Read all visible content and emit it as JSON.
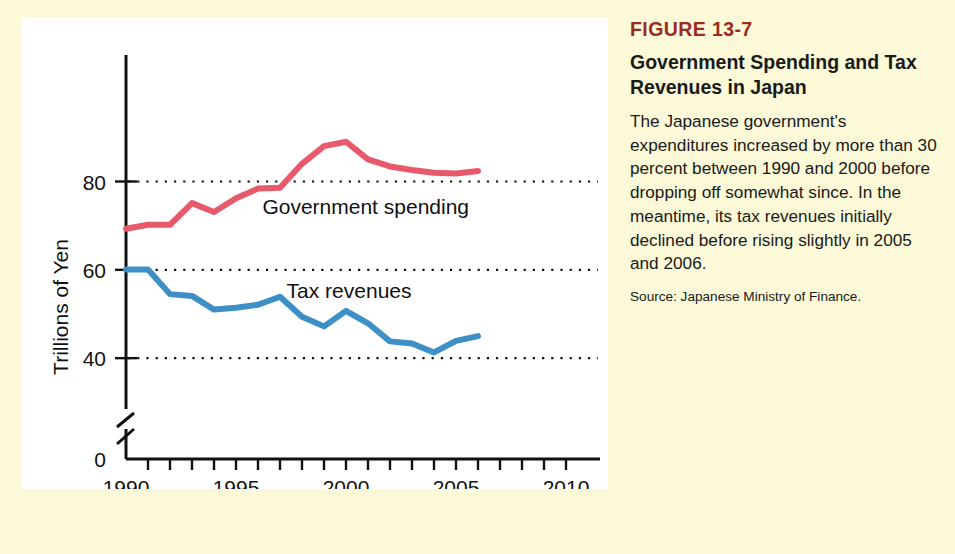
{
  "caption": {
    "figure_number": "FIGURE 13-7",
    "title": "Government Spending and Tax Revenues in Japan",
    "body": "The Japanese government's expenditures increased by more than 30 percent between 1990 and 2000 before dropping off somewhat since. In the meantime, its tax revenues initially declined before rising slightly in 2005 and 2006.",
    "source": "Source: Japanese Ministry of Finance."
  },
  "colors": {
    "background": "#fbf9d7",
    "panel": "#ffffff",
    "figure_number": "#9c2b1f",
    "government_spending": "#e8596b",
    "tax_revenues": "#3d8fc6",
    "axis": "#111111"
  },
  "chart_data": {
    "type": "line",
    "title": "Government Spending and Tax Revenues in Japan",
    "xlabel": "Year",
    "ylabel": "Trillions of Yen",
    "xlim": [
      1990,
      2010
    ],
    "ylim": [
      36,
      92
    ],
    "y_axis_break": true,
    "y_zero_label": "0",
    "grid": "horizontal-dotted",
    "legend": "inline-labels",
    "x_tick_labels": [
      "1990",
      "1995",
      "2000",
      "2005",
      "2010"
    ],
    "x_tick_values": [
      1990,
      1995,
      2000,
      2005,
      2010
    ],
    "x_minor_ticks": [
      1990,
      1991,
      1992,
      1993,
      1994,
      1995,
      1996,
      1997,
      1998,
      1999,
      2000,
      2001,
      2002,
      2003,
      2004,
      2005,
      2006,
      2007,
      2008,
      2009,
      2010
    ],
    "y_tick_labels": [
      "40",
      "60",
      "80"
    ],
    "y_tick_values": [
      40,
      60,
      80
    ],
    "x": [
      1990,
      1991,
      1992,
      1993,
      1994,
      1995,
      1996,
      1997,
      1998,
      1999,
      2000,
      2001,
      2002,
      2003,
      2004,
      2005,
      2006
    ],
    "series": [
      {
        "name": "Government spending",
        "color": "#e8596b",
        "label_x": 1996.2,
        "label_y": 72.6,
        "values": [
          69.3,
          70.2,
          70.2,
          75.1,
          73.1,
          76.2,
          78.4,
          78.6,
          84.0,
          88.0,
          89.0,
          85.0,
          83.4,
          82.6,
          82.0,
          81.8,
          82.4
        ]
      },
      {
        "name": "Tax revenues",
        "color": "#3d8fc6",
        "label_x": 1997.3,
        "label_y": 53.6,
        "values": [
          60.1,
          60.1,
          54.5,
          54.1,
          51.0,
          51.4,
          52.1,
          53.9,
          49.4,
          47.2,
          50.7,
          47.9,
          43.8,
          43.3,
          41.3,
          43.9,
          45.0
        ]
      }
    ]
  }
}
